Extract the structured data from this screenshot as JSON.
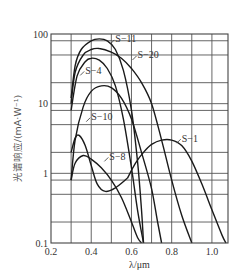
{
  "chart_data": {
    "type": "line",
    "title": "",
    "xlabel": "λ/μm",
    "ylabel": "光谱响应/(mA·W⁻¹)",
    "xscale": "linear",
    "yscale": "log",
    "xlim": [
      0.2,
      1.08
    ],
    "ylim": [
      0.1,
      100
    ],
    "grid": true,
    "x_ticks": [
      0.2,
      0.4,
      0.6,
      0.8,
      1.0
    ],
    "x_tick_labels": [
      "0.2",
      "0.4",
      "0.6",
      "0.8",
      "1.0"
    ],
    "y_ticks": [
      0.1,
      1,
      10,
      100
    ],
    "y_tick_labels": [
      "0.1",
      "1",
      "10",
      "100"
    ],
    "x_gridlines": [
      0.3,
      0.4,
      0.5,
      0.6,
      0.7,
      0.8,
      0.9,
      1.0
    ],
    "y_gridlines": [
      0.2,
      0.5,
      0.8,
      1,
      2,
      5,
      8,
      10,
      20,
      50,
      80
    ],
    "series": [
      {
        "name": "S-11",
        "label": "S−11",
        "points": [
          [
            0.3,
            12
          ],
          [
            0.32,
            35
          ],
          [
            0.35,
            60
          ],
          [
            0.4,
            80
          ],
          [
            0.44,
            85
          ],
          [
            0.48,
            80
          ],
          [
            0.52,
            60
          ],
          [
            0.56,
            30
          ],
          [
            0.6,
            8
          ],
          [
            0.63,
            1.5
          ],
          [
            0.65,
            0.3
          ],
          [
            0.66,
            0.1
          ]
        ]
      },
      {
        "name": "S-20",
        "label": "S−20",
        "points": [
          [
            0.3,
            10
          ],
          [
            0.32,
            28
          ],
          [
            0.36,
            50
          ],
          [
            0.4,
            60
          ],
          [
            0.44,
            62
          ],
          [
            0.5,
            55
          ],
          [
            0.55,
            45
          ],
          [
            0.6,
            32
          ],
          [
            0.65,
            20
          ],
          [
            0.7,
            10
          ],
          [
            0.75,
            3
          ],
          [
            0.8,
            0.8
          ],
          [
            0.85,
            0.25
          ],
          [
            0.9,
            0.1
          ]
        ]
      },
      {
        "name": "S-4",
        "label": "S−4",
        "points": [
          [
            0.3,
            8
          ],
          [
            0.33,
            25
          ],
          [
            0.37,
            40
          ],
          [
            0.4,
            45
          ],
          [
            0.44,
            42
          ],
          [
            0.48,
            32
          ],
          [
            0.52,
            18
          ],
          [
            0.56,
            6
          ],
          [
            0.6,
            1.2
          ],
          [
            0.63,
            0.3
          ],
          [
            0.66,
            0.1
          ]
        ]
      },
      {
        "name": "S-10",
        "label": "S−10",
        "points": [
          [
            0.3,
            0.8
          ],
          [
            0.32,
            3
          ],
          [
            0.36,
            9
          ],
          [
            0.4,
            15
          ],
          [
            0.45,
            18
          ],
          [
            0.5,
            17
          ],
          [
            0.55,
            12
          ],
          [
            0.6,
            6
          ],
          [
            0.65,
            2
          ],
          [
            0.7,
            0.6
          ],
          [
            0.73,
            0.2
          ],
          [
            0.75,
            0.1
          ]
        ]
      },
      {
        "name": "S-1 (UV bump)",
        "label": "",
        "points": [
          [
            0.3,
            2
          ],
          [
            0.32,
            3.2
          ],
          [
            0.34,
            3.5
          ],
          [
            0.37,
            2.5
          ],
          [
            0.4,
            1.3
          ],
          [
            0.43,
            0.7
          ],
          [
            0.47,
            0.55
          ],
          [
            0.52,
            0.62
          ],
          [
            0.58,
            0.85
          ]
        ]
      },
      {
        "name": "S-8",
        "label": "S−8",
        "points": [
          [
            0.3,
            0.8
          ],
          [
            0.32,
            1.4
          ],
          [
            0.36,
            1.8
          ],
          [
            0.4,
            1.6
          ],
          [
            0.45,
            1.2
          ],
          [
            0.5,
            0.8
          ],
          [
            0.55,
            0.45
          ],
          [
            0.6,
            0.2
          ],
          [
            0.63,
            0.12
          ],
          [
            0.65,
            0.1
          ]
        ]
      },
      {
        "name": "S-1",
        "label": "S−1",
        "points": [
          [
            0.58,
            0.85
          ],
          [
            0.62,
            1.4
          ],
          [
            0.66,
            2
          ],
          [
            0.7,
            2.6
          ],
          [
            0.75,
            3
          ],
          [
            0.8,
            3
          ],
          [
            0.85,
            2.5
          ],
          [
            0.9,
            1.5
          ],
          [
            0.95,
            0.7
          ],
          [
            1.0,
            0.3
          ],
          [
            1.05,
            0.13
          ],
          [
            1.07,
            0.1
          ]
        ]
      }
    ],
    "annotations": [
      {
        "text": "S−11",
        "x": 0.52,
        "y": 85
      },
      {
        "text": "S−20",
        "x": 0.63,
        "y": 50
      },
      {
        "text": "S−4",
        "x": 0.37,
        "y": 30
      },
      {
        "text": "S−10",
        "x": 0.4,
        "y": 6.5
      },
      {
        "text": "S−8",
        "x": 0.49,
        "y": 1.75
      },
      {
        "text": "S−1",
        "x": 0.85,
        "y": 3.2
      }
    ]
  }
}
